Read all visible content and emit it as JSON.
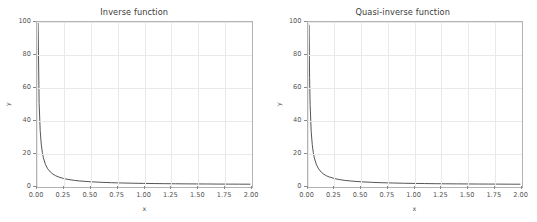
{
  "figure": {
    "width": 537,
    "height": 222,
    "background": "#ffffff",
    "grid_color": "#e9e9e9",
    "axis_color": "#b3b3b3",
    "line_color": "#3f3f3f",
    "text_color": "#555555"
  },
  "chart_data": [
    {
      "type": "line",
      "title": "Inverse function",
      "xlabel": "x",
      "ylabel": "y",
      "xlim": [
        0.0,
        2.0
      ],
      "ylim": [
        0.0,
        100.0
      ],
      "grid": true,
      "legend": "none",
      "xticks": [
        "0.00",
        "0.25",
        "0.50",
        "0.75",
        "1.00",
        "1.25",
        "1.50",
        "1.75",
        "2.00"
      ],
      "xtick_values": [
        0.0,
        0.25,
        0.5,
        0.75,
        1.0,
        1.25,
        1.5,
        1.75,
        2.0
      ],
      "yticks": [
        "0",
        "20",
        "40",
        "60",
        "80",
        "100"
      ],
      "ytick_values": [
        0,
        20,
        40,
        60,
        80,
        100
      ],
      "series": [
        {
          "name": "1/x",
          "x": [
            0.01,
            0.02,
            0.03,
            0.04,
            0.05,
            0.06,
            0.08,
            0.1,
            0.125,
            0.15,
            0.175,
            0.2,
            0.25,
            0.3,
            0.35,
            0.4,
            0.5,
            0.6,
            0.7,
            0.8,
            0.9,
            1.0,
            1.1,
            1.2,
            1.3,
            1.4,
            1.5,
            1.6,
            1.7,
            1.8,
            1.9,
            2.0
          ],
          "values": [
            100.0,
            50.0,
            33.33,
            25.0,
            20.0,
            16.67,
            12.5,
            10.0,
            8.0,
            6.67,
            5.71,
            5.0,
            4.0,
            3.33,
            2.86,
            2.5,
            2.0,
            1.67,
            1.43,
            1.25,
            1.11,
            1.0,
            0.91,
            0.83,
            0.77,
            0.71,
            0.67,
            0.63,
            0.59,
            0.56,
            0.53,
            0.5
          ]
        }
      ]
    },
    {
      "type": "line",
      "title": "Quasi-inverse function",
      "xlabel": "x",
      "ylabel": "y",
      "xlim": [
        0.0,
        2.0
      ],
      "ylim": [
        0.0,
        100.0
      ],
      "grid": true,
      "legend": "none",
      "xticks": [
        "0.00",
        "0.25",
        "0.50",
        "0.75",
        "1.00",
        "1.25",
        "1.50",
        "1.75",
        "2.00"
      ],
      "xtick_values": [
        0.0,
        0.25,
        0.5,
        0.75,
        1.0,
        1.25,
        1.5,
        1.75,
        2.0
      ],
      "yticks": [
        "0",
        "20",
        "40",
        "60",
        "80",
        "100"
      ],
      "ytick_values": [
        0,
        20,
        40,
        60,
        80,
        100
      ],
      "series": [
        {
          "name": "quasi 1/x",
          "x": [
            0.01,
            0.015,
            0.02,
            0.03,
            0.04,
            0.05,
            0.06,
            0.08,
            0.1,
            0.125,
            0.15,
            0.175,
            0.2,
            0.25,
            0.3,
            0.35,
            0.4,
            0.5,
            0.6,
            0.7,
            0.8,
            0.9,
            1.0,
            1.1,
            1.2,
            1.3,
            1.4,
            1.5,
            1.6,
            1.7,
            1.8,
            1.9,
            2.0
          ],
          "values": [
            98.0,
            66.0,
            49.5,
            33.0,
            24.8,
            19.8,
            16.5,
            12.4,
            9.9,
            7.9,
            6.6,
            5.65,
            4.95,
            3.96,
            3.3,
            2.83,
            2.48,
            1.98,
            1.65,
            1.41,
            1.24,
            1.1,
            0.99,
            0.9,
            0.82,
            0.76,
            0.71,
            0.66,
            0.62,
            0.58,
            0.55,
            0.52,
            0.49
          ]
        }
      ]
    }
  ]
}
